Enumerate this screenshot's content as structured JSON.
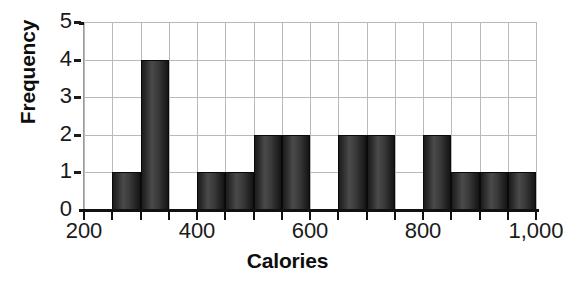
{
  "chart_data": {
    "type": "bar",
    "title": "",
    "subtitle": "",
    "xlabel": "Calories",
    "ylabel": "Frequency",
    "bin_width": 50,
    "xlim": [
      200,
      1000
    ],
    "ylim": [
      0,
      5
    ],
    "grid": true,
    "legend": null,
    "legend_position": "none",
    "x_tick_labels": [
      "200",
      "400",
      "600",
      "800",
      "1,000"
    ],
    "x_tick_values": [
      200,
      400,
      600,
      800,
      1000
    ],
    "y_tick_labels": [
      "0",
      "1",
      "2",
      "3",
      "4",
      "5"
    ],
    "y_tick_values": [
      0,
      1,
      2,
      3,
      4,
      5
    ],
    "categories": [
      "200-250",
      "250-300",
      "300-350",
      "350-400",
      "400-450",
      "450-500",
      "500-550",
      "550-600",
      "600-650",
      "650-700",
      "700-750",
      "750-800",
      "800-850",
      "850-900",
      "900-950",
      "950-1000"
    ],
    "bin_edges": [
      200,
      250,
      300,
      350,
      400,
      450,
      500,
      550,
      600,
      650,
      700,
      750,
      800,
      850,
      900,
      950,
      1000
    ],
    "values": [
      0,
      1,
      4,
      0,
      1,
      1,
      2,
      2,
      0,
      2,
      2,
      0,
      2,
      1,
      1,
      1
    ],
    "bar_color": "#2e2e2e",
    "grid_color": "#b9b9b9",
    "axis_color": "#111111",
    "background_color": "#ffffff"
  },
  "axes": {
    "y_title": "Frequency",
    "x_title": "Calories"
  }
}
